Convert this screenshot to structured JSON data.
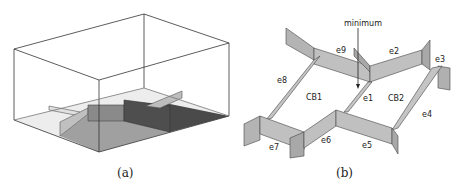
{
  "figure": {
    "panels": [
      {
        "id": "a",
        "caption": "(a)",
        "description": "3D box domain with walls on a floor"
      },
      {
        "id": "b",
        "caption": "(b)",
        "description": "Network of edge walls around two cells"
      }
    ]
  },
  "panel_b": {
    "annotation": "minimum",
    "edges": [
      "e1",
      "e2",
      "e3",
      "e4",
      "e5",
      "e6",
      "e7",
      "e8",
      "e9"
    ],
    "cells": [
      "CB1",
      "CB2"
    ]
  },
  "colors": {
    "wall_light": "#c8c8c8",
    "wall_mid": "#a8a8a8",
    "floor_light": "#e6e6e6",
    "floor_mid": "#9a9a9a",
    "floor_dark": "#555555",
    "stroke": "#333333"
  }
}
